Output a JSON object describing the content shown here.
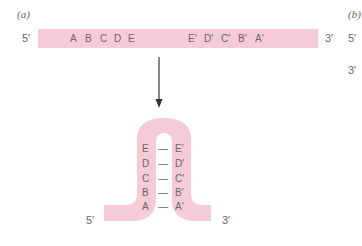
{
  "panel_a": {
    "label": "(a)",
    "strand": {
      "five_prime": "5′",
      "three_prime": "3′",
      "left_sequence": [
        "A",
        "B",
        "C",
        "D",
        "E"
      ],
      "right_sequence": [
        "E′",
        "D′",
        "C′",
        "B′",
        "A′"
      ]
    },
    "hairpin": {
      "five_prime": "5′",
      "three_prime": "3′",
      "pairs": [
        {
          "left": "E",
          "bond": "—",
          "right": "E′"
        },
        {
          "left": "D",
          "bond": "—",
          "right": "D′"
        },
        {
          "left": "C",
          "bond": "—",
          "right": "C′"
        },
        {
          "left": "B",
          "bond": "—",
          "right": "B′"
        },
        {
          "left": "A",
          "bond": "—",
          "right": "A′"
        }
      ]
    }
  },
  "panel_b": {
    "label": "(b)",
    "five_prime": "5′",
    "three_prime": "3′"
  },
  "colors": {
    "strand_fill": "#f5cbd8",
    "text": "#666666",
    "arrow": "#333333"
  }
}
